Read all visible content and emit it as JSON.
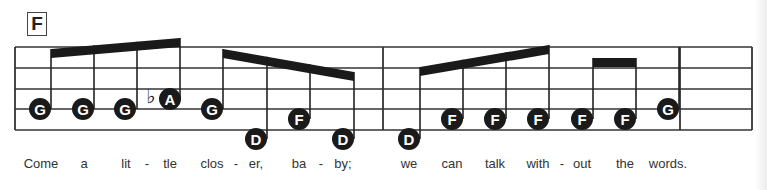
{
  "chord": "F",
  "staff": {
    "left": 15,
    "right": 752,
    "lines_y": [
      47,
      68,
      89,
      109,
      130
    ],
    "barlines_x": [
      15,
      383,
      680,
      752
    ]
  },
  "notes": [
    {
      "name": "G",
      "x": 40,
      "y": 109,
      "stem_x": 51
    },
    {
      "name": "G",
      "x": 83,
      "y": 109,
      "stem_x": 94
    },
    {
      "name": "G",
      "x": 125,
      "y": 109,
      "stem_x": 137
    },
    {
      "name": "A",
      "x": 170,
      "y": 99,
      "stem_x": 180,
      "accidental": "♭"
    },
    {
      "name": "G",
      "x": 212,
      "y": 109,
      "stem_x": 223
    },
    {
      "name": "D",
      "x": 256,
      "y": 139,
      "stem_x": 267
    },
    {
      "name": "F",
      "x": 299,
      "y": 119,
      "stem_x": 310
    },
    {
      "name": "D",
      "x": 343,
      "y": 139,
      "stem_x": 354
    },
    {
      "name": "D",
      "x": 409,
      "y": 139,
      "stem_x": 420
    },
    {
      "name": "F",
      "x": 452,
      "y": 119,
      "stem_x": 463
    },
    {
      "name": "F",
      "x": 495,
      "y": 119,
      "stem_x": 506
    },
    {
      "name": "F",
      "x": 538,
      "y": 119,
      "stem_x": 549
    },
    {
      "name": "F",
      "x": 582,
      "y": 119,
      "stem_x": 593
    },
    {
      "name": "F",
      "x": 625,
      "y": 119,
      "stem_x": 636
    },
    {
      "name": "G",
      "x": 668,
      "y": 109,
      "stem_x": 679
    }
  ],
  "beams": [
    {
      "x1": 51,
      "y1": 49,
      "x2": 180,
      "y2": 38
    },
    {
      "x1": 223,
      "y1": 49,
      "x2": 354,
      "y2": 72
    },
    {
      "x1": 420,
      "y1": 67,
      "x2": 549,
      "y2": 45
    },
    {
      "x1": 593,
      "y1": 58,
      "x2": 636,
      "y2": 58
    }
  ],
  "lyrics": [
    {
      "text": "Come",
      "x": 41
    },
    {
      "text": "a",
      "x": 84
    },
    {
      "text": "lit",
      "x": 126
    },
    {
      "text": "-",
      "x": 147
    },
    {
      "text": "tle",
      "x": 170
    },
    {
      "text": "clos",
      "x": 212
    },
    {
      "text": "-",
      "x": 236
    },
    {
      "text": "er,",
      "x": 256
    },
    {
      "text": "ba",
      "x": 299
    },
    {
      "text": "-",
      "x": 321
    },
    {
      "text": "by;",
      "x": 343
    },
    {
      "text": "we",
      "x": 409
    },
    {
      "text": "can",
      "x": 452
    },
    {
      "text": "talk",
      "x": 495
    },
    {
      "text": "with",
      "x": 538
    },
    {
      "text": "-",
      "x": 562
    },
    {
      "text": "out",
      "x": 582
    },
    {
      "text": "the",
      "x": 625
    },
    {
      "text": "words.",
      "x": 668
    }
  ]
}
